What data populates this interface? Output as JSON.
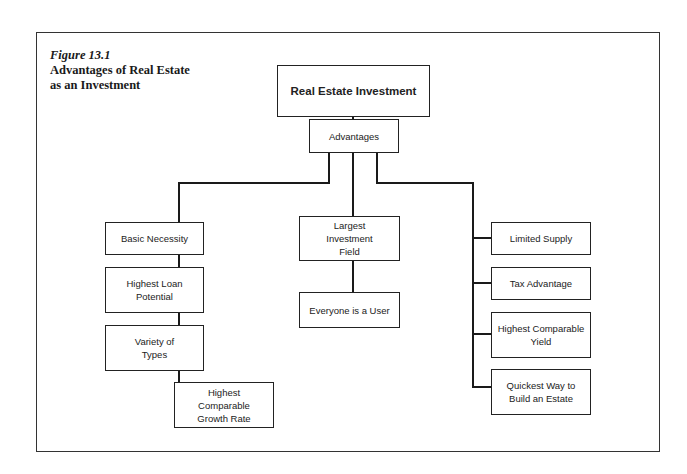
{
  "figure": {
    "number": "Figure 13.1",
    "title_lines": [
      "Advantages of Real Estate",
      "as an Investment"
    ]
  },
  "root": {
    "label": "Real Estate Investment"
  },
  "advantages": {
    "label": "Advantages"
  },
  "left_branch": [
    {
      "lines": [
        "Basic Necessity"
      ]
    },
    {
      "lines": [
        "Highest Loan",
        "Potential"
      ]
    },
    {
      "lines": [
        "Variety of",
        "Types"
      ]
    },
    {
      "lines": [
        "Highest",
        "Comparable",
        "Growth Rate"
      ]
    }
  ],
  "center_branch": [
    {
      "lines": [
        "Largest",
        "Investment",
        "Field"
      ]
    },
    {
      "lines": [
        "Everyone is a User"
      ]
    }
  ],
  "right_branch": [
    {
      "lines": [
        "Limited Supply"
      ]
    },
    {
      "lines": [
        "Tax Advantage"
      ]
    },
    {
      "lines": [
        "Highest Comparable",
        "Yield"
      ]
    },
    {
      "lines": [
        "Quickest Way to",
        "Build an Estate"
      ]
    }
  ]
}
